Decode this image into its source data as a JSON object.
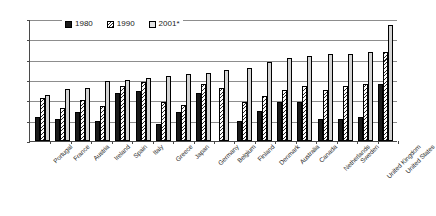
{
  "chart_data": {
    "type": "bar",
    "title": "",
    "subtitle": "",
    "xlabel": "",
    "ylabel": "",
    "ylim": [
      0,
      30
    ],
    "ytick_values": [
      0,
      5,
      10,
      15,
      20,
      25,
      30
    ],
    "ytick_labels": [
      "0",
      "5",
      "10",
      "15",
      "20",
      "25",
      "30"
    ],
    "grid": true,
    "grid_axis": "y",
    "legend_position": "top-center",
    "orientation": "vertical",
    "categories": [
      "Portugal",
      "France",
      "Austria",
      "Ireland",
      "Spain",
      "Italy",
      "Greece",
      "Japan",
      "Germany",
      "Belgium",
      "Finland",
      "Denmark",
      "Australia",
      "Canada",
      "Netherlands",
      "Sweden",
      "United Kingdom",
      "United States"
    ],
    "series": [
      {
        "name": "1980",
        "color": "#1a1a1a",
        "pattern": "solid",
        "values": [
          6.0,
          5.5,
          7.2,
          4.8,
          11.8,
          12.3,
          4.2,
          7.2,
          11.8,
          0.0,
          5.0,
          7.5,
          9.5,
          9.5,
          5.5,
          5.5,
          6.0,
          14.0
        ]
      },
      {
        "name": "1990",
        "color": "#2b2b2b",
        "pattern": "diagonal-hatch",
        "values": [
          10.5,
          8.0,
          10.0,
          8.5,
          13.5,
          14.4,
          9.7,
          8.9,
          14.1,
          13.0,
          9.5,
          11.0,
          12.5,
          13.5,
          12.5,
          13.5,
          14.0,
          22.0
        ]
      },
      {
        "name": "2001*",
        "color": "#d4d4d4",
        "pattern": "solid-light",
        "values": [
          11.2,
          12.8,
          13.0,
          14.7,
          15.0,
          15.5,
          16.0,
          16.6,
          16.8,
          17.5,
          18.0,
          19.5,
          20.5,
          21.0,
          21.5,
          21.5,
          21.8,
          28.5
        ]
      }
    ]
  },
  "legend": {
    "items": [
      {
        "label": "1980",
        "swatch": "legend-swatch-1980"
      },
      {
        "label": "1990",
        "swatch": "legend-swatch-1990"
      },
      {
        "label": "2001*",
        "swatch": "legend-swatch-2001"
      }
    ]
  }
}
